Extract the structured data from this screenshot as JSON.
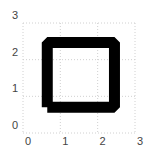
{
  "chart_data": {
    "type": "line",
    "title": "",
    "xlabel": "",
    "ylabel": "",
    "xlim": [
      0,
      3
    ],
    "ylim": [
      0,
      3
    ],
    "grid": true,
    "x_ticks": [
      "0",
      "1",
      "2",
      "3"
    ],
    "y_ticks": [
      "0",
      "1",
      "2",
      "3"
    ],
    "series": [
      {
        "name": "square",
        "color": "#000000",
        "line_width": "thick",
        "x": [
          0.65,
          2.45,
          2.45,
          0.65,
          0.65
        ],
        "y": [
          0.7,
          0.7,
          2.47,
          2.47,
          0.7
        ]
      }
    ]
  }
}
